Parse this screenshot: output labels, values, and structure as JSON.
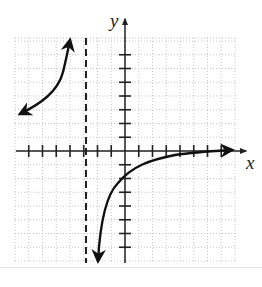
{
  "chart_data": {
    "type": "line",
    "title": "",
    "xlabel": "x",
    "ylabel": "y",
    "xlim": [
      -8,
      8
    ],
    "ylim": [
      -8,
      8
    ],
    "grid": true,
    "grid_style": "dotted",
    "tick_spacing": 1,
    "legend": null,
    "vertical_asymptote": -3,
    "horizontal_asymptote": 0,
    "function_description": "rational function with vertical asymptote x = -3 and horizontal asymptote y = 0 (approx. y = -6/(x+3)); y-intercept approx -2",
    "series": [
      {
        "name": "left branch",
        "points": [
          [
            -7.7,
            2.7
          ],
          [
            -7,
            3.0
          ],
          [
            -6,
            3.6
          ],
          [
            -5,
            4.6
          ],
          [
            -4.5,
            5.6
          ],
          [
            -4.0,
            8.0
          ]
        ],
        "arrows": "both ends"
      },
      {
        "name": "right branch",
        "points": [
          [
            -2.0,
            -8.0
          ],
          [
            -1.5,
            -4.5
          ],
          [
            -1,
            -3.2
          ],
          [
            0,
            -1.9
          ],
          [
            1,
            -1.2
          ],
          [
            2,
            -0.8
          ],
          [
            3,
            -0.55
          ],
          [
            4,
            -0.35
          ],
          [
            5,
            -0.2
          ],
          [
            6,
            -0.1
          ],
          [
            7,
            -0.05
          ],
          [
            8,
            0.0
          ]
        ],
        "arrows": "both ends"
      }
    ],
    "annotations": [
      "dashed vertical line at x = -3"
    ]
  },
  "labels": {
    "x_axis": "x",
    "y_axis": "y"
  },
  "colors": {
    "curve": "#111111",
    "axis": "#222222",
    "grid": "#b8b8b8",
    "background": "#ffffff"
  }
}
